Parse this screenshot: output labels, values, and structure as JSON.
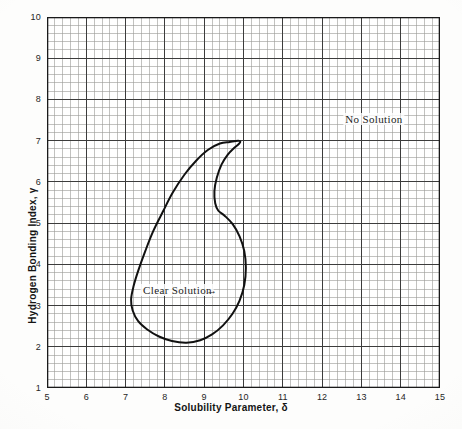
{
  "figure": {
    "kind": "scientific-plot",
    "background_color": "#fdfdfc",
    "plot_background_color": "#ffffff"
  },
  "chart_data": {
    "type": "line",
    "title": "",
    "subtitle": "",
    "xlabel": "Solubility Parameter, δ",
    "ylabel": "Hydrogen Bonding Index, γ",
    "xlim": [
      5,
      15
    ],
    "ylim": [
      1,
      10
    ],
    "x_major_step": 1,
    "y_major_step": 1,
    "x_minor_divisions_per_major": 5,
    "y_minor_divisions_per_major": 5,
    "grid": true,
    "grid_style": "engineering graph paper, major and minor rules",
    "legend": false,
    "legend_position": "none",
    "xticks": [
      "5",
      "6",
      "7",
      "8",
      "9",
      "10",
      "11",
      "12",
      "13",
      "14",
      "15"
    ],
    "yticks": [
      "1",
      "2",
      "3",
      "4",
      "5",
      "6",
      "7",
      "8",
      "9",
      "10"
    ],
    "series": [
      {
        "name": "Clear Solution boundary",
        "kind": "closed-contour",
        "closed": true,
        "stroke": "#111111",
        "stroke_width": 2.0,
        "fill": "none",
        "points": [
          [
            9.65,
            6.97
          ],
          [
            9.4,
            6.93
          ],
          [
            9.1,
            6.78
          ],
          [
            8.8,
            6.52
          ],
          [
            8.5,
            6.18
          ],
          [
            8.2,
            5.74
          ],
          [
            7.95,
            5.28
          ],
          [
            7.7,
            4.8
          ],
          [
            7.5,
            4.32
          ],
          [
            7.32,
            3.84
          ],
          [
            7.2,
            3.46
          ],
          [
            7.14,
            3.15
          ],
          [
            7.18,
            2.88
          ],
          [
            7.32,
            2.62
          ],
          [
            7.55,
            2.42
          ],
          [
            7.85,
            2.25
          ],
          [
            8.18,
            2.14
          ],
          [
            8.55,
            2.1
          ],
          [
            8.9,
            2.16
          ],
          [
            9.2,
            2.3
          ],
          [
            9.48,
            2.52
          ],
          [
            9.72,
            2.8
          ],
          [
            9.9,
            3.12
          ],
          [
            10.02,
            3.5
          ],
          [
            10.06,
            3.92
          ],
          [
            10.02,
            4.32
          ],
          [
            9.9,
            4.68
          ],
          [
            9.72,
            4.98
          ],
          [
            9.52,
            5.18
          ],
          [
            9.36,
            5.3
          ],
          [
            9.28,
            5.48
          ],
          [
            9.26,
            5.78
          ],
          [
            9.32,
            6.1
          ],
          [
            9.44,
            6.42
          ],
          [
            9.6,
            6.66
          ],
          [
            9.76,
            6.82
          ],
          [
            9.88,
            6.92
          ],
          [
            9.92,
            6.98
          ],
          [
            9.86,
            7.0
          ],
          [
            9.65,
            6.97
          ]
        ],
        "extrema": {
          "top": [
            9.65,
            6.97
          ],
          "bottom": [
            8.55,
            2.1
          ],
          "leftmost": [
            7.14,
            3.15
          ],
          "rightmost": [
            10.06,
            3.92
          ],
          "notch_indent": [
            9.26,
            5.4
          ]
        }
      }
    ],
    "annotations": [
      {
        "id": "no-solution",
        "text": "No Solution",
        "x": 13.32,
        "y": 7.53,
        "region": "outside-contour"
      },
      {
        "id": "clear-solution",
        "text": "Clear Solution",
        "x": 8.32,
        "y": 3.37,
        "region": "inside-contour",
        "leader": {
          "glyph": "arrow-right",
          "from_x": 9.05,
          "from_y": 3.37,
          "to_x": 9.65,
          "to_y": 3.37
        }
      }
    ]
  },
  "colors": {
    "curve": "#111111",
    "grid_major": "#3c3c3c",
    "grid_minor": "#9a9a96",
    "axis": "#1a1a1a",
    "text": "#1a1a1a"
  }
}
